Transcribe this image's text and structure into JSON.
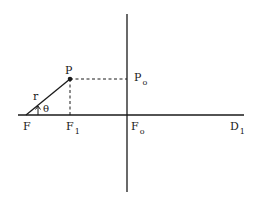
{
  "diagram": {
    "type": "geometry",
    "colors": {
      "ink": "#1a1a1a",
      "background": "#ffffff"
    },
    "labels": {
      "P": {
        "main": "P",
        "sub": ""
      },
      "P0": {
        "main": "P",
        "sub": "o"
      },
      "r": {
        "main": "r",
        "sub": ""
      },
      "theta": {
        "main": "θ",
        "sub": ""
      },
      "F": {
        "main": "F",
        "sub": ""
      },
      "F1": {
        "main": "F",
        "sub": "1"
      },
      "F0": {
        "main": "F",
        "sub": "o"
      },
      "D1": {
        "main": "D",
        "sub": "1"
      }
    },
    "elements": [
      {
        "name": "horizontal-axis",
        "style": "solid"
      },
      {
        "name": "vertical-axis",
        "style": "solid"
      },
      {
        "name": "radius-line-F-to-P",
        "style": "solid",
        "label": "r"
      },
      {
        "name": "dashed-P-to-P0",
        "style": "dashed"
      },
      {
        "name": "dashed-P-to-F1",
        "style": "dashed"
      },
      {
        "name": "angle-arrow-theta",
        "style": "arrow",
        "label": "θ"
      },
      {
        "name": "point-P",
        "style": "filled-dot"
      }
    ]
  }
}
